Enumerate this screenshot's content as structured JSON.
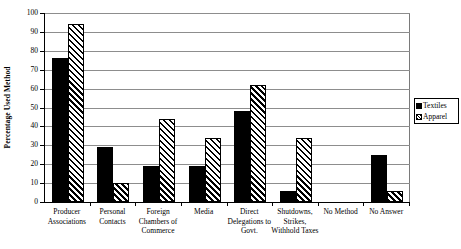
{
  "chart_data": {
    "type": "bar",
    "title": "",
    "xlabel": "",
    "ylabel": "Percentage Used Method",
    "ylim": [
      0,
      100
    ],
    "ytick_step": 10,
    "yticks": [
      0,
      10,
      20,
      30,
      40,
      50,
      60,
      70,
      80,
      90,
      100
    ],
    "grid": true,
    "legend_position": "right",
    "categories": [
      "Producer Associations",
      "Personal Contacts",
      "Foreign Chambers of Commerce",
      "Media",
      "Direct Delegations to Govt.",
      "Shutdowns, Strikes, Withhold Taxes",
      "No Method",
      "No Answer"
    ],
    "category_lines": [
      [
        "Producer",
        "Associations"
      ],
      [
        "Personal",
        "Contacts"
      ],
      [
        "Foreign",
        "Chambers of",
        "Commerce"
      ],
      [
        "Media"
      ],
      [
        "Direct",
        "Delegations to",
        "Govt."
      ],
      [
        "Shutdowns,",
        "Strikes,",
        "Withhold Taxes"
      ],
      [
        "No Method"
      ],
      [
        "No Answer"
      ]
    ],
    "series": [
      {
        "name": "Textiles",
        "fill": "solid-black",
        "color": "#000000",
        "values": [
          76,
          29,
          19,
          19,
          48,
          6,
          0,
          25
        ]
      },
      {
        "name": "Apparel",
        "fill": "diagonal-hatch",
        "color": "#000000",
        "values": [
          94,
          10,
          44,
          34,
          62,
          34,
          0,
          6
        ]
      }
    ]
  },
  "legend": {
    "items": [
      {
        "label": "Textiles",
        "swatch": "solid-black-square-icon"
      },
      {
        "label": "Apparel",
        "swatch": "hatched-square-icon"
      }
    ]
  },
  "axis": {
    "y_title": "Percentage Used Method",
    "y_tick_labels": [
      "100",
      "90",
      "80",
      "70",
      "60",
      "50",
      "40",
      "30",
      "20",
      "10",
      "0"
    ]
  }
}
